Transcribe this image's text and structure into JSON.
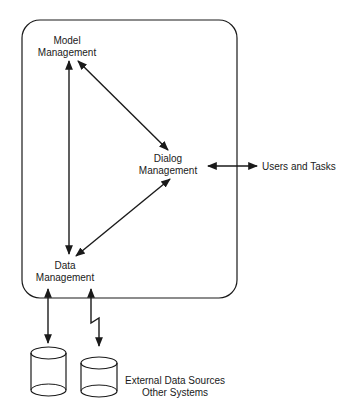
{
  "diagram": {
    "nodes": {
      "model": {
        "line1": "Model",
        "line2": "Management"
      },
      "dialog": {
        "line1": "Dialog",
        "line2": "Management"
      },
      "data": {
        "line1": "Data",
        "line2": "Management"
      }
    },
    "external": {
      "users": "Users and Tasks",
      "sources_line1": "External Data Sources",
      "sources_line2": "Other Systems"
    },
    "connections": [
      {
        "from": "Model Management",
        "to": "Data Management",
        "type": "bidirectional"
      },
      {
        "from": "Model Management",
        "to": "Dialog Management",
        "type": "bidirectional"
      },
      {
        "from": "Data Management",
        "to": "Dialog Management",
        "type": "bidirectional"
      },
      {
        "from": "Dialog Management",
        "to": "Users and Tasks",
        "type": "bidirectional"
      },
      {
        "from": "Data Management",
        "to": "Internal Database",
        "type": "bidirectional"
      },
      {
        "from": "Data Management",
        "to": "External Data Sources",
        "type": "remote-link"
      }
    ],
    "colors": {
      "stroke": "#1a1a1a",
      "background": "#ffffff"
    }
  }
}
